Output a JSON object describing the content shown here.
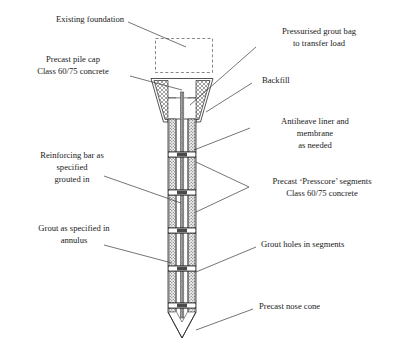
{
  "figure": {
    "background_color": "#ffffff",
    "line_color": "#2a2a2a",
    "leader_color": "#3a3a3a",
    "dashed_color": "#6a6a6a"
  },
  "labels": {
    "existing_foundation": {
      "lines": [
        "Existing foundation"
      ],
      "side": "left"
    },
    "precast_pile_cap": {
      "lines": [
        "Precast pile cap",
        "Class 60/75 concrete"
      ],
      "side": "left"
    },
    "reinforcing_bar": {
      "lines": [
        "Reinforcing bar as",
        "specified",
        "grouted in"
      ],
      "side": "left"
    },
    "grout_annulus": {
      "lines": [
        "Grout as specified in",
        "annulus"
      ],
      "side": "left"
    },
    "pressurised_grout_bag": {
      "lines": [
        "Pressurised grout bag",
        "to transfer load"
      ],
      "side": "right"
    },
    "backfill": {
      "lines": [
        "Backfill"
      ],
      "side": "right"
    },
    "antiheave_liner": {
      "lines": [
        "Antiheave liner and",
        "membrane",
        "as needed"
      ],
      "side": "right"
    },
    "presscore_segments": {
      "lines": [
        "Precast ‘Presscore’ segments",
        "Class 60/75 concrete"
      ],
      "side": "right"
    },
    "grout_holes": {
      "lines": [
        "Grout holes in segments"
      ],
      "side": "right"
    },
    "precast_nose_cone": {
      "lines": [
        "Precast nose cone"
      ],
      "side": "right"
    }
  },
  "components": {
    "existing_foundation_box": "dashed-rectangle",
    "pile_cap": "trapezoid-with-hatched-wedges",
    "shaft_segments_count": 5,
    "nose_cone": "pointed-v-tip",
    "central_bar": "vertical-reinforcing-bar"
  }
}
